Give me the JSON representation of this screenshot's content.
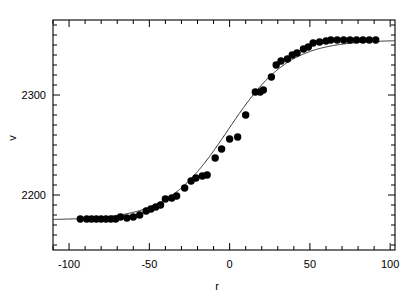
{
  "figure": {
    "background_color": "#ffffff",
    "ink_color": "#000000"
  },
  "chart_data": {
    "type": "scatter",
    "title": "",
    "xlabel": "r",
    "ylabel": "v",
    "xlim": [
      -110,
      103
    ],
    "ylim": [
      2145,
      2375
    ],
    "grid": false,
    "legend": null,
    "xticks": [
      -100,
      -50,
      0,
      50,
      100
    ],
    "xtick_labels": [
      "-100",
      "-50",
      "0",
      "50",
      "100"
    ],
    "xminor_step": 10,
    "yticks": [
      2200,
      2300
    ],
    "ytick_labels": [
      "2200",
      "2300"
    ],
    "yminor_step": 10,
    "marker": "filled-circle",
    "marker_size": 5,
    "marker_color": "#000000",
    "series": [
      {
        "name": "observed",
        "kind": "scatter",
        "x": [
          -93,
          -89,
          -86,
          -83,
          -80,
          -77,
          -74,
          -71,
          -68,
          -64,
          -60,
          -56,
          -52,
          -49,
          -46,
          -43,
          -40,
          -36,
          -33,
          -28,
          -24,
          -21,
          -17,
          -14,
          -9,
          -5,
          0,
          5,
          10,
          16,
          19,
          21,
          26,
          29,
          32,
          36,
          39,
          42,
          46,
          49,
          52,
          56,
          60,
          63,
          67,
          71,
          75,
          79,
          83,
          87,
          91
        ],
        "y": [
          2176,
          2176,
          2176,
          2176,
          2176,
          2176,
          2176,
          2176,
          2178,
          2177,
          2178,
          2180,
          2184,
          2186,
          2188,
          2190,
          2196,
          2197,
          2199,
          2207,
          2214,
          2217,
          2219,
          2220,
          2237,
          2246,
          2256,
          2258,
          2280,
          2303,
          2303,
          2305,
          2318,
          2330,
          2334,
          2336,
          2340,
          2342,
          2346,
          2348,
          2352,
          2353,
          2354,
          2355,
          2355,
          2355,
          2355,
          2355,
          2355,
          2355,
          2355
        ]
      },
      {
        "name": "fit",
        "kind": "line",
        "line_color": "#303030",
        "line_width": 1,
        "model": "logistic",
        "params": {
          "lower": 2175,
          "upper": 2355,
          "midpoint": -1,
          "scale": 19
        }
      }
    ],
    "annotations": [
      {
        "note": "one point near r=5 lies well below the fitted curve",
        "x": 5,
        "y": 2258
      }
    ]
  }
}
